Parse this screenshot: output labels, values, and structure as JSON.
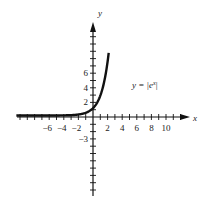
{
  "chart_data": {
    "type": "line",
    "title": "",
    "equation_label": "y = |e",
    "equation_exponent": "x",
    "equation_close": "|",
    "xlabel": "x",
    "ylabel": "y",
    "x_tick_labels": [
      "-6",
      "-4",
      "-2",
      "2",
      "4",
      "6",
      "8",
      "10"
    ],
    "x_tick_values": [
      -6,
      -4,
      -2,
      2,
      4,
      6,
      8,
      10
    ],
    "y_tick_labels": [
      "2",
      "4",
      "6",
      "-3"
    ],
    "y_tick_values": [
      2,
      4,
      6,
      -3
    ],
    "xlim": [
      -10.5,
      13
    ],
    "ylim": [
      -10.5,
      12
    ],
    "grid": false,
    "series": [
      {
        "name": "y = |e^x|",
        "function": "exp(x)",
        "x_range": [
          -10.5,
          2.2
        ]
      }
    ]
  },
  "colors": {
    "curve": "#111111",
    "axis": "#111111",
    "text": "#222222"
  }
}
